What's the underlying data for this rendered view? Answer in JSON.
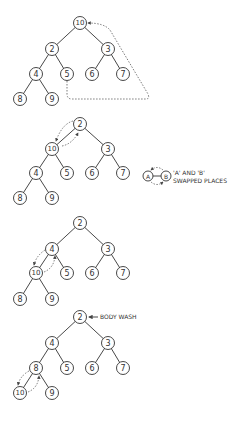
{
  "diagram": {
    "node_radius": 6.5,
    "stroke_color": "#333333",
    "trees": [
      {
        "id": "step-1",
        "nodes": [
          {
            "v": "10",
            "x": 80,
            "y": 23
          },
          {
            "v": "2",
            "x": 52,
            "y": 49
          },
          {
            "v": "3",
            "x": 108,
            "y": 49
          },
          {
            "v": "4",
            "x": 36,
            "y": 74
          },
          {
            "v": "5",
            "x": 67,
            "y": 74
          },
          {
            "v": "6",
            "x": 92,
            "y": 74
          },
          {
            "v": "7",
            "x": 123,
            "y": 74
          },
          {
            "v": "8",
            "x": 20,
            "y": 99
          },
          {
            "v": "9",
            "x": 52,
            "y": 99
          }
        ]
      },
      {
        "id": "step-2",
        "nodes": [
          {
            "v": "2",
            "x": 80,
            "y": 124
          },
          {
            "v": "10",
            "x": 52,
            "y": 149
          },
          {
            "v": "3",
            "x": 108,
            "y": 149
          },
          {
            "v": "4",
            "x": 36,
            "y": 173
          },
          {
            "v": "5",
            "x": 67,
            "y": 173
          },
          {
            "v": "6",
            "x": 92,
            "y": 173
          },
          {
            "v": "7",
            "x": 123,
            "y": 173
          },
          {
            "v": "8",
            "x": 20,
            "y": 198
          },
          {
            "v": "9",
            "x": 52,
            "y": 198
          }
        ]
      },
      {
        "id": "step-3",
        "nodes": [
          {
            "v": "2",
            "x": 80,
            "y": 223
          },
          {
            "v": "4",
            "x": 52,
            "y": 249
          },
          {
            "v": "3",
            "x": 108,
            "y": 249
          },
          {
            "v": "10",
            "x": 36,
            "y": 273
          },
          {
            "v": "5",
            "x": 67,
            "y": 273
          },
          {
            "v": "6",
            "x": 92,
            "y": 273
          },
          {
            "v": "7",
            "x": 123,
            "y": 273
          },
          {
            "v": "8",
            "x": 20,
            "y": 299
          },
          {
            "v": "9",
            "x": 52,
            "y": 299
          }
        ]
      },
      {
        "id": "step-4",
        "nodes": [
          {
            "v": "2",
            "x": 80,
            "y": 317
          },
          {
            "v": "4",
            "x": 52,
            "y": 343
          },
          {
            "v": "3",
            "x": 108,
            "y": 343
          },
          {
            "v": "8",
            "x": 36,
            "y": 368
          },
          {
            "v": "5",
            "x": 67,
            "y": 368
          },
          {
            "v": "6",
            "x": 92,
            "y": 368
          },
          {
            "v": "7",
            "x": 123,
            "y": 368
          },
          {
            "v": "10",
            "x": 20,
            "y": 393
          },
          {
            "v": "9",
            "x": 52,
            "y": 393
          }
        ]
      }
    ],
    "edges": [
      [
        0,
        1
      ],
      [
        0,
        2
      ],
      [
        1,
        3
      ],
      [
        1,
        4
      ],
      [
        2,
        5
      ],
      [
        2,
        6
      ],
      [
        3,
        7
      ],
      [
        3,
        8
      ]
    ],
    "legend": {
      "node_a": "A",
      "node_b": "B",
      "line1": "'A' AND 'B'",
      "line2": "SWAPPED PLACES"
    },
    "annotation": {
      "body_wash": "BODY WASH"
    }
  }
}
